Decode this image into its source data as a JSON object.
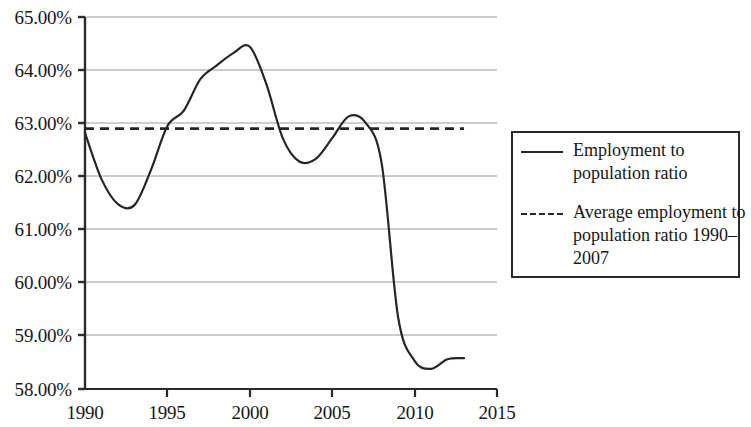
{
  "chart_data": {
    "type": "line",
    "title": "",
    "xlabel": "",
    "ylabel": "",
    "xlim": [
      1990,
      2015
    ],
    "ylim": [
      58.0,
      65.0
    ],
    "grid": true,
    "y_tick_labels": [
      "65.00%",
      "64.00%",
      "63.00%",
      "62.00%",
      "61.00%",
      "60.00%",
      "59.00%",
      "58.00%"
    ],
    "y_tick_values": [
      65.0,
      64.0,
      63.0,
      62.0,
      61.0,
      60.0,
      59.0,
      58.0
    ],
    "x_tick_labels": [
      "1990",
      "1995",
      "2000",
      "2005",
      "2010",
      "2015"
    ],
    "x_tick_values": [
      1990,
      1995,
      2000,
      2005,
      2010,
      2015
    ],
    "legend_position": "right",
    "series": [
      {
        "name": "Employment to population ratio",
        "style": "solid",
        "color": "#262626",
        "x": [
          1990,
          1991,
          1992,
          1993,
          1994,
          1995,
          1996,
          1997,
          1998,
          1999,
          2000,
          2001,
          2002,
          2003,
          2004,
          2005,
          2006,
          2007,
          2008,
          2009,
          2010,
          2011,
          2012,
          2013
        ],
        "values": [
          62.82,
          61.95,
          61.48,
          61.46,
          62.12,
          62.95,
          63.24,
          63.83,
          64.09,
          64.32,
          64.44,
          63.74,
          62.72,
          62.28,
          62.33,
          62.72,
          63.13,
          63.02,
          62.25,
          59.35,
          58.53,
          58.38,
          58.56,
          58.58
        ]
      }
    ],
    "reference_line": {
      "name": "Average employment to population ratio 1990–2007",
      "style": "dashed",
      "color": "#262626",
      "value": 62.9,
      "x_start": 1990,
      "x_end": 2013
    }
  },
  "legend": {
    "entries": [
      {
        "sample": "solid-line-sample",
        "label": "Employment to population ratio"
      },
      {
        "sample": "dashed-line-sample",
        "label": "Average employment to population ratio 1990–2007"
      }
    ]
  },
  "axes": {
    "y": {
      "labels": [
        "65.00%",
        "64.00%",
        "63.00%",
        "62.00%",
        "61.00%",
        "60.00%",
        "59.00%",
        "58.00%"
      ]
    },
    "x": {
      "labels": [
        "1990",
        "1995",
        "2000",
        "2005",
        "2010",
        "2015"
      ]
    }
  }
}
